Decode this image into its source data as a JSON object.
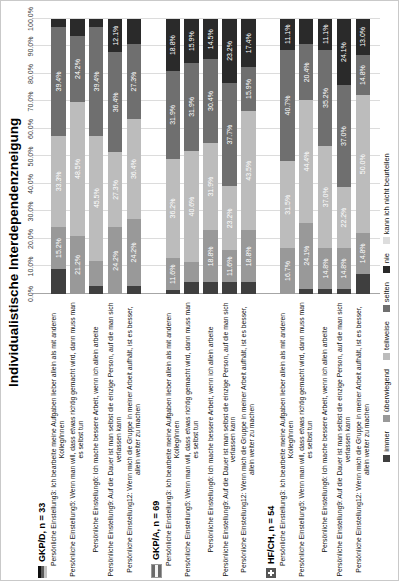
{
  "title": "Individualistische Interdependenzneigung",
  "x_axis": {
    "tick_labels": [
      "0.0%",
      "10.0%",
      "20.0%",
      "30.0%",
      "40.0%",
      "50.0%",
      "60.0%",
      "70.0%",
      "80.0%",
      "90.0%",
      "100.0%"
    ]
  },
  "legend": {
    "items": [
      {
        "label": "immer",
        "color": "#3f3f3f"
      },
      {
        "label": "überwiegend",
        "color": "#999999"
      },
      {
        "label": "teilweise",
        "color": "#bcbcbc"
      },
      {
        "label": "selten",
        "color": "#6f6f6f"
      },
      {
        "label": "nie",
        "color": "#2a2a2a"
      },
      {
        "label": "kann ich nicht beurteilen",
        "color": "#dddddd"
      }
    ]
  },
  "questions": [
    "Persönliche Einstellung3: Ich bearbeite meine Aufgaben lieber allein als mit anderen Kolleg/innen",
    "Persönliche Einstellung5: Wenn man will, dass etwas richtig gemacht wird, dann muss man es selbst tun",
    "Persönliche Einstellung6: Ich mache bessere Arbeit, wenn ich allein arbeite",
    "Persönliche Einstellung9: Auf die Dauer ist man selbst die einzige Person, auf die man sich verlassen kann",
    "Persönliche Einstellung12: Wenn mich die Gruppe in meiner Arbeit aufhält, ist es besser, allein weiter zu machen"
  ],
  "chart_data": {
    "type": "bar",
    "subtype": "horizontal-stacked-100pct",
    "orientation": "page rotated 90° (landscape chart shown in portrait)",
    "xlabel": "",
    "ylabel": "",
    "xlim": [
      0,
      100
    ],
    "grid": true,
    "legend_position": "bottom",
    "series_names": [
      "immer",
      "überwiegend",
      "teilweise",
      "selten",
      "nie",
      "kann ich nicht beurteilen"
    ],
    "value_labels": "white, shown only for segments ≥ 10%",
    "groups": [
      {
        "name": "GKP/D, n = 33",
        "flag": "germany",
        "rows": [
          {
            "question_index": 0,
            "values": [
              9.1,
              15.2,
              33.3,
              39.4,
              3.0,
              0
            ]
          },
          {
            "question_index": 1,
            "values": [
              0,
              21.2,
              48.5,
              24.2,
              6.1,
              0
            ]
          },
          {
            "question_index": 2,
            "values": [
              3.0,
              9.1,
              45.5,
              39.4,
              3.0,
              0
            ]
          },
          {
            "question_index": 3,
            "values": [
              0,
              24.2,
              27.3,
              36.4,
              12.1,
              0
            ]
          },
          {
            "question_index": 4,
            "values": [
              3.0,
              24.2,
              36.4,
              27.3,
              9.1,
              0
            ]
          }
        ]
      },
      {
        "name": "GKP/A, n = 69",
        "flag": "austria",
        "rows": [
          {
            "question_index": 0,
            "values": [
              1.4,
              11.6,
              36.2,
              31.9,
              18.8,
              0
            ]
          },
          {
            "question_index": 1,
            "values": [
              4.3,
              7.2,
              40.6,
              31.9,
              15.9,
              0
            ]
          },
          {
            "question_index": 2,
            "values": [
              4.3,
              18.8,
              31.9,
              30.4,
              14.5,
              0
            ]
          },
          {
            "question_index": 3,
            "values": [
              4.3,
              11.6,
              23.2,
              37.7,
              23.2,
              0
            ]
          },
          {
            "question_index": 4,
            "values": [
              4.3,
              18.8,
              43.5,
              15.9,
              17.4,
              0
            ]
          }
        ]
      },
      {
        "name": "HF/CH, n = 54",
        "flag": "switzerland",
        "rows": [
          {
            "question_index": 0,
            "values": [
              0,
              16.7,
              31.5,
              40.7,
              11.1,
              0
            ]
          },
          {
            "question_index": 1,
            "values": [
              1.9,
              24.1,
              44.4,
              20.4,
              9.3,
              0
            ]
          },
          {
            "question_index": 2,
            "values": [
              1.9,
              14.8,
              37.0,
              35.2,
              11.1,
              0
            ]
          },
          {
            "question_index": 3,
            "values": [
              1.9,
              14.8,
              22.2,
              37.0,
              24.1,
              0
            ]
          },
          {
            "question_index": 4,
            "values": [
              7.4,
              14.8,
              50.0,
              14.8,
              13.0,
              0
            ]
          }
        ]
      }
    ]
  }
}
